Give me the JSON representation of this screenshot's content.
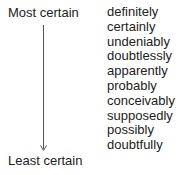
{
  "diagram": {
    "top_label": "Most certain",
    "bottom_label": "Least certain",
    "axis_icon": "down-arrow",
    "words": [
      "definitely",
      "certainly",
      "undeniably",
      "doubtlessly",
      "apparently",
      "probably",
      "conceivably",
      "supposedly",
      "possibly",
      "doubtfully"
    ]
  }
}
